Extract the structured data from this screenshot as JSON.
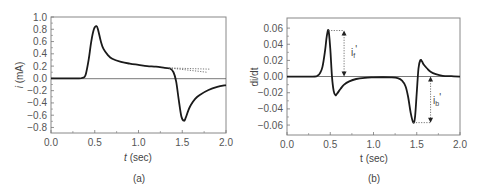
{
  "chart_data": [
    {
      "id": "a",
      "type": "line",
      "panel_label": "(a)",
      "title": "",
      "xlabel": "t (sec)",
      "ylabel": "i (mA)",
      "xlim": [
        0.0,
        2.0
      ],
      "ylim": [
        -0.9,
        1.0
      ],
      "xticks": [
        "0.0",
        "0.5",
        "1.0",
        "1.5",
        "2.0"
      ],
      "yticks": [
        "1.0",
        "0.8",
        "0.6",
        "0.4",
        "0.2",
        "0.0",
        "-0.2",
        "-0.4",
        "-0.6",
        "-0.8"
      ],
      "grid": false,
      "zero_line": true,
      "series": [
        {
          "name": "current",
          "style": "solid",
          "x": [
            0.0,
            0.3,
            0.35,
            0.38,
            0.4,
            0.43,
            0.46,
            0.49,
            0.52,
            0.54,
            0.57,
            0.6,
            0.65,
            0.7,
            0.8,
            0.9,
            1.0,
            1.1,
            1.2,
            1.3,
            1.36,
            1.4,
            1.43,
            1.46,
            1.49,
            1.52,
            1.54,
            1.57,
            1.6,
            1.65,
            1.7,
            1.8,
            1.9,
            2.0
          ],
          "y": [
            0.0,
            0.0,
            0.005,
            0.02,
            0.08,
            0.3,
            0.6,
            0.8,
            0.85,
            0.78,
            0.6,
            0.48,
            0.38,
            0.32,
            0.27,
            0.24,
            0.22,
            0.2,
            0.19,
            0.17,
            0.16,
            0.1,
            -0.05,
            -0.35,
            -0.62,
            -0.69,
            -0.64,
            -0.52,
            -0.43,
            -0.33,
            -0.27,
            -0.19,
            -0.14,
            -0.11
          ]
        },
        {
          "name": "baseline-extrapolation-1",
          "style": "dotted",
          "x": [
            1.35,
            1.82
          ],
          "y": [
            0.17,
            0.15
          ]
        },
        {
          "name": "baseline-extrapolation-2",
          "style": "dotted",
          "x": [
            1.35,
            1.78
          ],
          "y": [
            0.17,
            0.1
          ]
        }
      ]
    },
    {
      "id": "b",
      "type": "line",
      "panel_label": "(b)",
      "title": "",
      "xlabel": "t (sec)",
      "ylabel": "di/dt",
      "xlim": [
        0.0,
        2.0
      ],
      "ylim": [
        -0.072,
        0.072
      ],
      "xticks": [
        "0.0",
        "0.5",
        "1.0",
        "1.5",
        "2.0"
      ],
      "yticks": [
        "0.06",
        "0.04",
        "0.02",
        "0.00",
        "-0.02",
        "-0.04",
        "-0.06"
      ],
      "grid": false,
      "zero_line": true,
      "series": [
        {
          "name": "derivative",
          "style": "solid",
          "x": [
            0.0,
            0.3,
            0.35,
            0.38,
            0.41,
            0.44,
            0.46,
            0.48,
            0.5,
            0.52,
            0.54,
            0.56,
            0.58,
            0.62,
            0.66,
            0.72,
            0.8,
            0.9,
            1.0,
            1.1,
            1.2,
            1.28,
            1.33,
            1.37,
            1.4,
            1.43,
            1.46,
            1.48,
            1.5,
            1.52,
            1.54,
            1.56,
            1.58,
            1.62,
            1.66,
            1.72,
            1.8,
            1.9,
            2.0
          ],
          "y": [
            0.0,
            0.0,
            0.001,
            0.004,
            0.012,
            0.032,
            0.05,
            0.057,
            0.035,
            0.0,
            -0.018,
            -0.023,
            -0.021,
            -0.015,
            -0.01,
            -0.006,
            -0.003,
            -0.0015,
            -0.001,
            -0.0008,
            -0.001,
            -0.002,
            -0.005,
            -0.012,
            -0.025,
            -0.045,
            -0.057,
            -0.05,
            -0.02,
            0.01,
            0.02,
            0.019,
            0.015,
            0.01,
            0.006,
            0.003,
            0.001,
            0.0005,
            0.0
          ]
        }
      ],
      "annotations": [
        {
          "label": "i_f'",
          "text_main": "i",
          "text_sub": "f",
          "text_prime": "'",
          "x": 0.66,
          "from_y": 0.057,
          "to_y": 0.0,
          "note": "double-headed arrow marking forward peak height"
        },
        {
          "label": "i_b'",
          "text_main": "i",
          "text_sub": "b",
          "text_prime": "'",
          "x": 1.66,
          "from_y": 0.0,
          "to_y": -0.057,
          "note": "double-headed arrow marking backward peak depth"
        }
      ]
    }
  ],
  "panels": {
    "a": {
      "label": "(a)",
      "xlabel_var": "t",
      "xlabel_unit": " (sec)",
      "ylabel_var": "i",
      "ylabel_unit": " (mA)"
    },
    "b": {
      "label": "(b)",
      "xlabel": "t (sec)",
      "ylabel": "di/dt",
      "ann_f_main": "i",
      "ann_f_sub": "f",
      "ann_b_main": "i",
      "ann_b_sub": "b",
      "prime": "'"
    }
  },
  "colors": {
    "line": "#1a1a1a",
    "axis": "#777777",
    "text": "#555555",
    "dotted": "#666666"
  }
}
